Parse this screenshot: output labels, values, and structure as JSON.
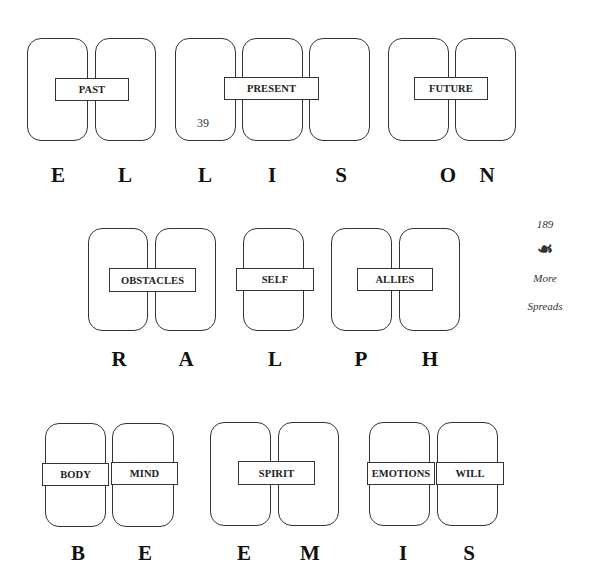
{
  "page": {
    "inner_page_number": "39",
    "margin_page_number": "189",
    "ornament": "☙",
    "margin_section_line1": "More",
    "margin_section_line2": "Spreads"
  },
  "rows": [
    {
      "name": "ELLISON",
      "groups": [
        {
          "label": "PAST",
          "cards": 2
        },
        {
          "label": "PRESENT",
          "cards": 3
        },
        {
          "label": "FUTURE",
          "cards": 2
        }
      ],
      "letters": [
        "E",
        "L",
        "L",
        "I",
        "S",
        "O",
        "N"
      ]
    },
    {
      "name": "RALPH",
      "groups": [
        {
          "label": "OBSTACLES",
          "cards": 2
        },
        {
          "label": "SELF",
          "cards": 1
        },
        {
          "label": "ALLIES",
          "cards": 2
        }
      ],
      "letters": [
        "R",
        "A",
        "L",
        "P",
        "H"
      ]
    },
    {
      "name": "BEEMIS",
      "groups": [
        {
          "label": "BODY",
          "cards": 1
        },
        {
          "label": "MIND",
          "cards": 1
        },
        {
          "label": "SPIRIT",
          "cards": 2
        },
        {
          "label": "EMOTIONS",
          "cards": 1
        },
        {
          "label": "WILL",
          "cards": 1
        }
      ],
      "letters": [
        "B",
        "E",
        "E",
        "M",
        "I",
        "S"
      ]
    }
  ]
}
